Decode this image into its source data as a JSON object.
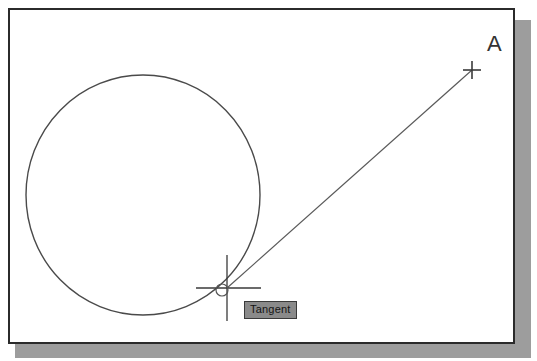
{
  "app": {
    "kind": "cad-drawing-window",
    "canvas_background": "#ffffff",
    "border_color": "#2b2b2b",
    "shadow_color": "#9d9d9d"
  },
  "drawing": {
    "geometry_color": "#4a4a4a",
    "cursor_color": "#3a3a3a",
    "entities": [
      {
        "name": "circle",
        "type": "circle",
        "cx": 143,
        "cy": 195,
        "rx": 117,
        "ry": 120
      },
      {
        "name": "rubber-band-line",
        "type": "line",
        "x1": 227,
        "y1": 288,
        "x2": 472,
        "y2": 70
      }
    ]
  },
  "cursor": {
    "name": "crosshair-cursor",
    "x": 227,
    "y": 288,
    "arm_length": 33,
    "snap_marker": {
      "type": "tangent-snap-marker",
      "shape": "circle",
      "cx": 222,
      "cy": 290,
      "r": 6
    }
  },
  "markers": [
    {
      "name": "point-marker-a",
      "type": "plus",
      "x": 472,
      "y": 70,
      "size": 9
    }
  ],
  "labels": {
    "point_a": "A"
  },
  "tooltip": {
    "text": "Tangent",
    "background": "#8a8a8a",
    "border": "#3a3a3a",
    "text_color": "#141414"
  }
}
